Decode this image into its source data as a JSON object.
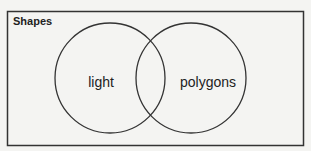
{
  "diagram": {
    "type": "venn",
    "title": "Shapes",
    "sets": [
      {
        "label": "light"
      },
      {
        "label": "polygons"
      }
    ],
    "intersection_label": ""
  },
  "colors": {
    "background": "#f4f4f2",
    "stroke": "#333333",
    "text": "#222222"
  }
}
